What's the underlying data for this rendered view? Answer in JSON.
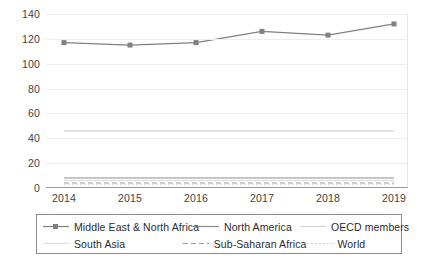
{
  "chart_data": {
    "type": "line",
    "title": "",
    "xlabel": "",
    "ylabel": "",
    "x": [
      2014,
      2015,
      2016,
      2017,
      2018,
      2019
    ],
    "xticklabels": [
      "2014",
      "2015",
      "2016",
      "2017",
      "2018",
      "2019"
    ],
    "yticklabels": [
      "0",
      "20",
      "40",
      "60",
      "80",
      "100",
      "120",
      "140"
    ],
    "yticks": [
      0,
      20,
      40,
      60,
      80,
      100,
      120,
      140
    ],
    "ylim": [
      0,
      140
    ],
    "grid": true,
    "legend_position": "bottom",
    "series": [
      {
        "name": "Middle East & North Africa",
        "values": [
          117,
          115,
          117,
          126,
          123,
          132
        ],
        "color": "#808080",
        "style": "solid-marker",
        "marker": "square"
      },
      {
        "name": "North America",
        "values": [
          8,
          8,
          8,
          8,
          8,
          8
        ],
        "color": "#8a8a8a",
        "style": "solid",
        "marker": "none"
      },
      {
        "name": "OECD members",
        "values": [
          46,
          46,
          46,
          46,
          46,
          46
        ],
        "color": "#d2d4d4",
        "style": "solid",
        "marker": "none"
      },
      {
        "name": "South Asia",
        "values": [
          6,
          6,
          6,
          6,
          6,
          6
        ],
        "color": "#dcdede",
        "style": "solid",
        "marker": "none"
      },
      {
        "name": "Sub-Saharan Africa",
        "values": [
          4,
          4,
          4,
          4,
          4,
          4
        ],
        "color": "#9a9a9a",
        "style": "dashed",
        "marker": "none"
      },
      {
        "name": "World",
        "values": [
          3,
          3,
          3,
          3,
          3,
          3
        ],
        "color": "#c8caca",
        "style": "dotted",
        "marker": "none"
      }
    ]
  },
  "legend": {
    "rows": [
      [
        "Middle East & North Africa",
        "North America",
        "OECD members"
      ],
      [
        "South Asia",
        "Sub-Saharan Africa",
        "World"
      ]
    ]
  },
  "colors": {
    "axis": "#9a9a9a",
    "grid": "#eceded",
    "text": "#3f3f3f",
    "legend_border": "#8c8c8c"
  }
}
